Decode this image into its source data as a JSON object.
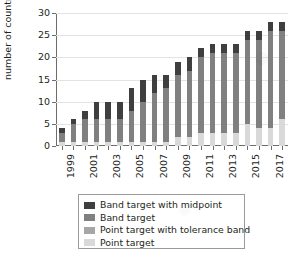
{
  "chart_data": {
    "type": "bar",
    "stacked": true,
    "title": "",
    "xlabel": "",
    "ylabel": "number of countries",
    "ylim": [
      0,
      30
    ],
    "ytick_step": 5,
    "yticks": [
      0,
      5,
      10,
      15,
      20,
      25,
      30
    ],
    "grid": true,
    "legend_position": "bottom",
    "categories": [
      "1999",
      "2000",
      "2001",
      "2002",
      "2003",
      "2004",
      "2005",
      "2006",
      "2007",
      "2008",
      "2009",
      "2010",
      "2011",
      "2012",
      "2013",
      "2014",
      "2015",
      "2016",
      "2017",
      "2018"
    ],
    "tick_labels_shown": [
      "1999",
      "2001",
      "2003",
      "2005",
      "2007",
      "2009",
      "2011",
      "2013",
      "2015",
      "2017"
    ],
    "series": [
      {
        "name": "Point target",
        "color": "#d9d9d9",
        "values": [
          1,
          1,
          1,
          1,
          1,
          1,
          1,
          1,
          1,
          1,
          2,
          2,
          3,
          3,
          3,
          3,
          5,
          4,
          4,
          6
        ]
      },
      {
        "name": "Point target with tolerance band",
        "color": "#a6a6a6",
        "values": [
          0,
          0,
          0,
          0,
          0,
          0,
          0,
          0,
          0,
          0,
          0,
          0,
          0,
          0,
          0,
          0,
          0,
          0,
          0,
          0
        ]
      },
      {
        "name": "Band target",
        "color": "#808080",
        "values": [
          2,
          4,
          5,
          5,
          5,
          5,
          7,
          9,
          11,
          12,
          14,
          15,
          17,
          18,
          18,
          18,
          19,
          20,
          22,
          20
        ]
      },
      {
        "name": "Band target with midpoint",
        "color": "#3f3f3f",
        "values": [
          1,
          1,
          2,
          4,
          4,
          4,
          5,
          5,
          4,
          3,
          3,
          3,
          2,
          2,
          2,
          2,
          2,
          2,
          2,
          2
        ]
      }
    ],
    "totals": [
      4,
      6,
      8,
      10,
      10,
      10,
      13,
      15,
      16,
      16,
      19,
      20,
      22,
      23,
      23,
      23,
      26,
      26,
      28,
      28
    ]
  },
  "legend": {
    "items": [
      {
        "label": "Band target with midpoint",
        "color": "#3f3f3f"
      },
      {
        "label": "Band target",
        "color": "#808080"
      },
      {
        "label": "Point target with tolerance band",
        "color": "#a6a6a6"
      },
      {
        "label": "Point target",
        "color": "#d9d9d9"
      }
    ]
  }
}
